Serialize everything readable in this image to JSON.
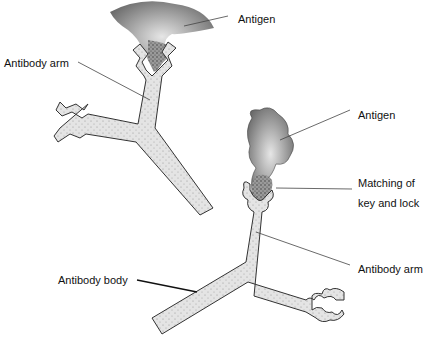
{
  "diagram": {
    "colors": {
      "antibody_fill": "#d9d9d9",
      "antibody_stroke": "#333333",
      "antigen_fill": "#8a8a8a",
      "antigen_core": "#555555",
      "leader": "#444444"
    },
    "labels": {
      "antigen_top": "Antigen",
      "antibody_arm_top": "Antibody arm",
      "antigen_right": "Antigen",
      "matching_line1": "Matching of",
      "matching_line2": "key and lock",
      "antibody_arm_bottom": "Antibody arm",
      "antibody_body": "Antibody body"
    }
  }
}
